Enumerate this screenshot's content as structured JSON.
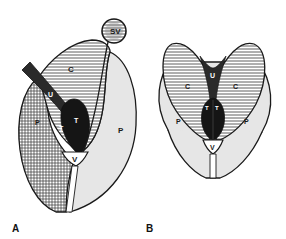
{
  "figure": {
    "panels": [
      {
        "id": "A",
        "label": "A",
        "structures": {
          "seminal_vesicle": "SV",
          "central_zone": "C",
          "urethra": "U",
          "transition_zone_left": "T",
          "transition_zone_right": "T",
          "peripheral_zone_left": "P",
          "peripheral_zone_right": "P",
          "verumontanum": "V"
        }
      },
      {
        "id": "B",
        "label": "B",
        "structures": {
          "central_zone_left": "C",
          "central_zone_right": "C",
          "urethra": "U",
          "transition_zone_left": "T",
          "transition_zone_right": "T",
          "peripheral_zone_left": "P",
          "peripheral_zone_right": "P",
          "verumontanum": "V"
        }
      }
    ],
    "colors": {
      "outline": "#1a1a1a",
      "peripheral_fill": "#e6e6e6",
      "transition_fill": "#151515",
      "urethra_fill": "#2a2a2a",
      "background": "#ffffff"
    }
  }
}
